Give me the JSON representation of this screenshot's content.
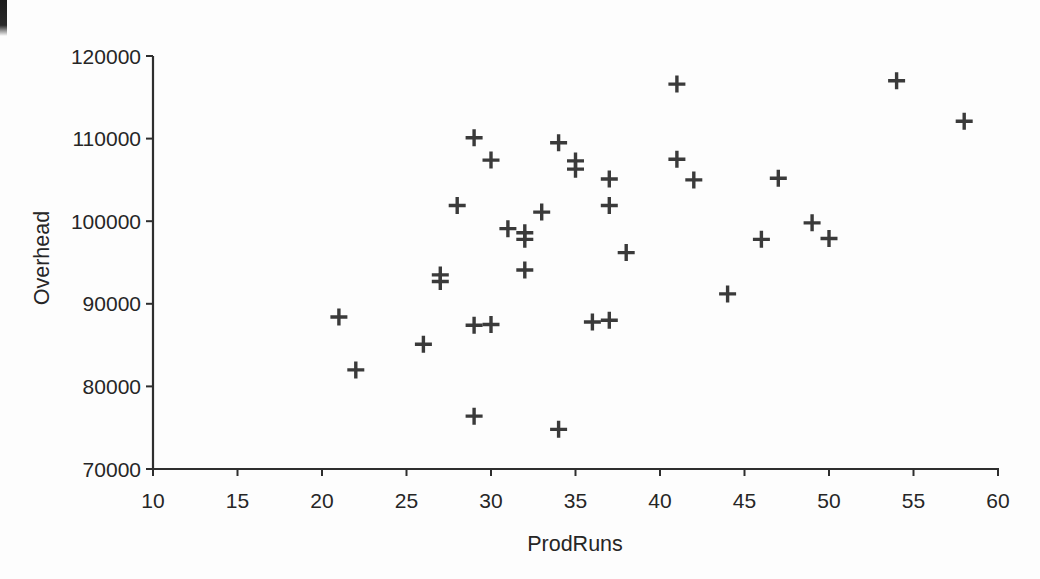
{
  "chart_data": {
    "type": "scatter",
    "title": "",
    "xlabel": "ProdRuns",
    "ylabel": "Overhead",
    "xlim": [
      10,
      60
    ],
    "ylim": [
      70000,
      120000
    ],
    "x_ticks": [
      10,
      15,
      20,
      25,
      30,
      35,
      40,
      45,
      50,
      55,
      60
    ],
    "y_ticks": [
      70000,
      80000,
      90000,
      100000,
      110000,
      120000
    ],
    "grid": false,
    "legend": false,
    "marker": "plus",
    "points": [
      {
        "x": 21,
        "y": 88400
      },
      {
        "x": 22,
        "y": 82000
      },
      {
        "x": 26,
        "y": 85100
      },
      {
        "x": 27,
        "y": 93500
      },
      {
        "x": 27,
        "y": 92700
      },
      {
        "x": 28,
        "y": 101900
      },
      {
        "x": 29,
        "y": 110100
      },
      {
        "x": 29,
        "y": 87400
      },
      {
        "x": 29,
        "y": 76400
      },
      {
        "x": 30,
        "y": 107400
      },
      {
        "x": 30,
        "y": 87500
      },
      {
        "x": 31,
        "y": 99100
      },
      {
        "x": 32,
        "y": 98600
      },
      {
        "x": 32,
        "y": 97800
      },
      {
        "x": 32,
        "y": 94100
      },
      {
        "x": 33,
        "y": 101100
      },
      {
        "x": 34,
        "y": 109500
      },
      {
        "x": 34,
        "y": 74800
      },
      {
        "x": 35,
        "y": 107300
      },
      {
        "x": 35,
        "y": 106300
      },
      {
        "x": 36,
        "y": 87800
      },
      {
        "x": 37,
        "y": 105100
      },
      {
        "x": 37,
        "y": 101900
      },
      {
        "x": 37,
        "y": 88000
      },
      {
        "x": 38,
        "y": 96200
      },
      {
        "x": 41,
        "y": 116600
      },
      {
        "x": 41,
        "y": 107500
      },
      {
        "x": 42,
        "y": 105000
      },
      {
        "x": 44,
        "y": 91200
      },
      {
        "x": 46,
        "y": 97800
      },
      {
        "x": 47,
        "y": 105200
      },
      {
        "x": 49,
        "y": 99800
      },
      {
        "x": 50,
        "y": 97900
      },
      {
        "x": 54,
        "y": 117000
      },
      {
        "x": 58,
        "y": 112100
      }
    ],
    "colors": {
      "marker": "#3a3a3a",
      "axis": "#2e2e2e",
      "text": "#262626",
      "background": "#fdfdfd"
    }
  }
}
